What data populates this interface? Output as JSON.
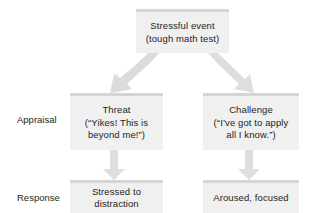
{
  "diagram": {
    "accent_color": "#d5d5d5",
    "box_fill": "#f0f0f0",
    "arrow_color": "#dedede",
    "text_color": "#231f20",
    "row_labels": [
      {
        "id": "appraisal",
        "label": "Appraisal"
      },
      {
        "id": "response",
        "label": "Response"
      }
    ],
    "nodes": {
      "event": {
        "line1": "Stressful event",
        "line2": "(tough math test)"
      },
      "threat": {
        "line1": "Threat",
        "line2": "(“Yikes! This is",
        "line3": "beyond me!”)"
      },
      "challenge": {
        "line1": "Challenge",
        "line2": "(“I’ve got to apply",
        "line3": "all I know.”)"
      },
      "stressed": {
        "line1": "Stressed to",
        "line2": "distraction"
      },
      "aroused": {
        "line1": "Aroused, focused"
      }
    },
    "edges": [
      {
        "id": "event-to-threat",
        "from": "event",
        "to": "threat",
        "direction": "down-left"
      },
      {
        "id": "event-to-challenge",
        "from": "event",
        "to": "challenge",
        "direction": "down-right"
      },
      {
        "id": "threat-to-stressed",
        "from": "threat",
        "to": "stressed",
        "direction": "down"
      },
      {
        "id": "challenge-to-aroused",
        "from": "challenge",
        "to": "aroused",
        "direction": "down"
      }
    ]
  }
}
